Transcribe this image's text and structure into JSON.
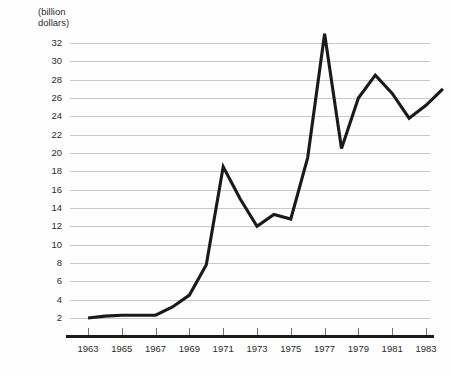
{
  "chart_data": {
    "type": "line",
    "title": "",
    "subtitle": "",
    "xlabel": "",
    "ylabel": "(billion\ndollars)",
    "ylabel_lines": [
      "(billion",
      "dollars)"
    ],
    "xlim": [
      1963,
      1984
    ],
    "ylim": [
      0,
      33
    ],
    "y_axis_ticks": [
      32,
      30,
      28,
      26,
      24,
      22,
      20,
      18,
      16,
      14,
      12,
      10,
      8,
      6,
      4,
      2
    ],
    "x_axis_ticks": [
      1963,
      1965,
      1967,
      1969,
      1971,
      1973,
      1975,
      1977,
      1979,
      1981,
      1983
    ],
    "grid": true,
    "legend": "none",
    "line_color": "#1a1a1a",
    "grid_color": "#c9c9c9",
    "axis_color": "#1a1a1a",
    "background_color": "#fefefe",
    "x": [
      1963,
      1964,
      1965,
      1966,
      1967,
      1968,
      1969,
      1970,
      1971,
      1972,
      1973,
      1974,
      1975,
      1976,
      1977,
      1978,
      1979,
      1980,
      1981,
      1982,
      1983,
      1984
    ],
    "values": [
      2.0,
      2.2,
      2.3,
      2.3,
      2.3,
      3.2,
      4.5,
      7.8,
      18.5,
      15.0,
      12.0,
      13.3,
      12.8,
      19.5,
      33.0,
      20.5,
      26.0,
      28.5,
      26.5,
      23.8,
      25.2,
      27.0
    ],
    "series": [
      {
        "name": "value",
        "values": [
          2.0,
          2.2,
          2.3,
          2.3,
          2.3,
          3.2,
          4.5,
          7.8,
          18.5,
          15.0,
          12.0,
          13.3,
          12.8,
          19.5,
          33.0,
          20.5,
          26.0,
          28.5,
          26.5,
          23.8,
          25.2,
          27.0
        ]
      }
    ]
  }
}
